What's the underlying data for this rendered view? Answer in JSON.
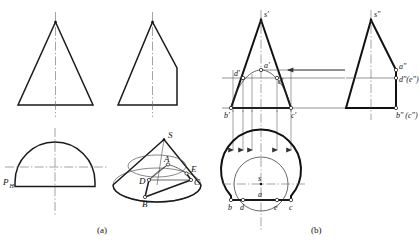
{
  "figure": {
    "title_sublabels": {
      "left": "(a)",
      "right": "(b)"
    },
    "panels": [
      {
        "id": "panel-a",
        "caption": "(a)",
        "views": [
          {
            "id": "front-view-plain-cone",
            "type": "triangle",
            "description": "isosceles triangle with vertical centerline"
          },
          {
            "id": "side-view-truncated-cone",
            "type": "triangle-cut",
            "description": "triangle with right side vertical cut"
          },
          {
            "id": "top-view-cut-circle",
            "type": "semicircle-flat",
            "description": "circle with flat chord at bottom",
            "label": "P",
            "label_sub": "H"
          },
          {
            "id": "pictorial-cone",
            "type": "pictorial",
            "description": "3D cone with oblique section",
            "labels": [
              "S",
              "A",
              "E",
              "C",
              "D",
              "B"
            ]
          }
        ]
      },
      {
        "id": "panel-b",
        "caption": "(b)",
        "views": [
          {
            "id": "front-view-projection",
            "type": "triangle-with-section",
            "point_labels": [
              "s'",
              "a'",
              "d'",
              "e'",
              "b'",
              "c'"
            ]
          },
          {
            "id": "side-view-projection",
            "type": "triangle-cut",
            "point_labels": [
              "s\"",
              "a\"",
              "d\"(e\")",
              "b\" (c\")"
            ]
          },
          {
            "id": "top-view-projection",
            "type": "circle-with-chord",
            "point_labels": [
              "s",
              "a",
              "b",
              "d",
              "e",
              "c"
            ]
          }
        ]
      }
    ],
    "point_labels": {
      "S_upper": "S",
      "A_upper": "A",
      "B_upper": "B",
      "C_upper": "C",
      "D_upper": "D",
      "E_upper": "E",
      "s_front": "s'",
      "a_front": "a'",
      "d_front": "d'",
      "e_front": "e'",
      "b_front": "b'",
      "c_front": "c'",
      "s_side": "s\"",
      "a_side": "a\"",
      "de_side": "d\"(e\")",
      "bc_side": "b\" (c\")",
      "s_top": "s",
      "a_top": "a",
      "b_top": "b",
      "d_top": "d",
      "e_top": "e",
      "c_top": "c",
      "plane_P": "P",
      "plane_P_sub": "H"
    },
    "colors": {
      "line": "#1a1a1a",
      "thin_line": "#555555",
      "background": "#ffffff",
      "marker_fill": "#ffffff"
    }
  }
}
